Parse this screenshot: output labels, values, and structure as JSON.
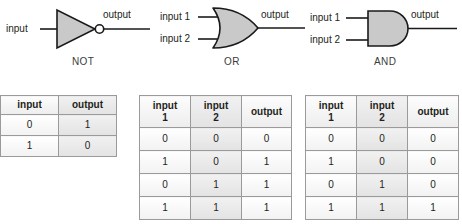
{
  "figure": {
    "gates": [
      {
        "name": "NOT",
        "symbol": "not-gate",
        "inputs": [
          "input"
        ],
        "output": "output"
      },
      {
        "name": "OR",
        "symbol": "or-gate",
        "inputs": [
          "input 1",
          "input 2"
        ],
        "output": "output"
      },
      {
        "name": "AND",
        "symbol": "and-gate",
        "inputs": [
          "input 1",
          "input 2"
        ],
        "output": "output"
      }
    ],
    "tables": [
      {
        "gate": "NOT",
        "headers": [
          "input",
          "output"
        ],
        "header_lines2": [
          "",
          ""
        ],
        "rows": [
          [
            "0",
            "1"
          ],
          [
            "1",
            "0"
          ]
        ]
      },
      {
        "gate": "OR",
        "headers": [
          "input",
          "input",
          "output"
        ],
        "header_lines2": [
          "1",
          "2",
          ""
        ],
        "rows": [
          [
            "0",
            "0",
            "0"
          ],
          [
            "1",
            "0",
            "1"
          ],
          [
            "0",
            "1",
            "1"
          ],
          [
            "1",
            "1",
            "1"
          ]
        ]
      },
      {
        "gate": "AND",
        "headers": [
          "input",
          "input",
          "output"
        ],
        "header_lines2": [
          "1",
          "2",
          ""
        ],
        "rows": [
          [
            "0",
            "0",
            "0"
          ],
          [
            "1",
            "0",
            "0"
          ],
          [
            "0",
            "1",
            "0"
          ],
          [
            "1",
            "1",
            "1"
          ]
        ]
      }
    ],
    "colors": {
      "gate_fill": "#c9c9c9",
      "gate_stroke": "#1a1a1a",
      "wire": "#1a1a1a",
      "table_border": "#7d7d7d",
      "text": "#231f20"
    }
  }
}
